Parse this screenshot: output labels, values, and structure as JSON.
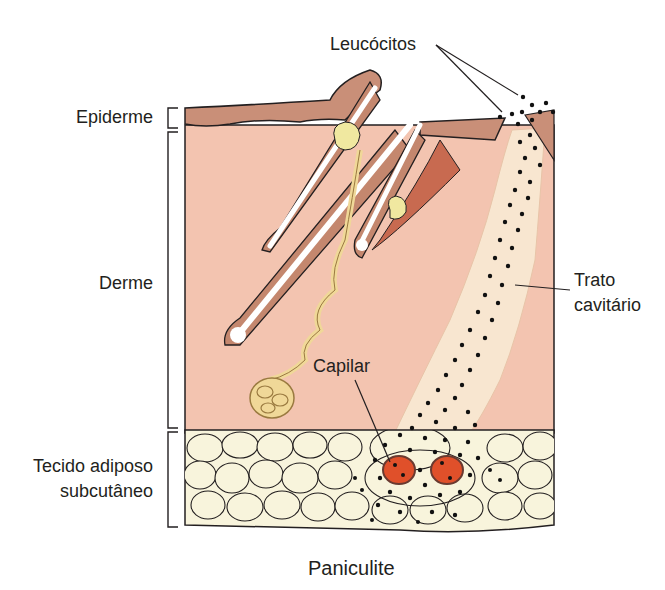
{
  "figure": {
    "title": "Paniculite",
    "labels": {
      "leucocitos": "Leucócitos",
      "epiderme": "Epiderme",
      "derme": "Derme",
      "trato_line1": "Trato",
      "trato_line2": "cavitário",
      "capilar": "Capilar",
      "tecido_line1": "Tecido adiposo",
      "tecido_line2": "subcutâneo"
    },
    "colors": {
      "epidermis": "#c98f78",
      "dermis": "#f3c4b0",
      "fat": "#f8f4dc",
      "capillary": "#e0502a",
      "tract": "#f8e6d0",
      "hair_shaft": "#ffffff",
      "follicle": "#c4876e",
      "gland": "#f0d898",
      "muscle": "#c86a50",
      "outline": "#231f20"
    }
  }
}
